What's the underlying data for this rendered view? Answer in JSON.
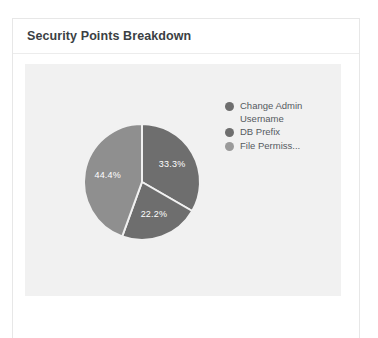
{
  "card": {
    "title": "Security Points Breakdown"
  },
  "chart_data": {
    "type": "pie",
    "title": "Security Points Breakdown",
    "xlabel": "",
    "ylabel": "",
    "legend_position": "right",
    "grid": false,
    "categories": [
      "Change Admin Username",
      "DB Prefix",
      "File Permiss..."
    ],
    "values": [
      33.3,
      22.2,
      44.4
    ],
    "value_labels": [
      "33.3%",
      "22.2%",
      "44.4%"
    ],
    "colors": [
      "#6e6e6e",
      "#6e6e6e",
      "#8f8f8f"
    ],
    "slices": [
      {
        "label": "Change Admin Username",
        "value": 33.3,
        "value_label": "33.3%",
        "color": "#6e6e6e",
        "start_angle": 0,
        "end_angle": 120
      },
      {
        "label": "DB Prefix",
        "value": 22.2,
        "value_label": "22.2%",
        "color": "#6e6e6e",
        "start_angle": 120,
        "end_angle": 200
      },
      {
        "label": "File Permiss...",
        "value": 44.4,
        "value_label": "44.4%",
        "color": "#8f8f8f",
        "start_angle": 200,
        "end_angle": 360
      }
    ]
  },
  "legend": {
    "items": [
      {
        "label": "Change Admin Username",
        "color": "#6e6e6e"
      },
      {
        "label": "DB Prefix",
        "color": "#6e6e6e"
      },
      {
        "label": "File Permiss...",
        "color": "#9a9a9a"
      }
    ]
  },
  "plot_area": {
    "background": "#f1f1f1"
  }
}
